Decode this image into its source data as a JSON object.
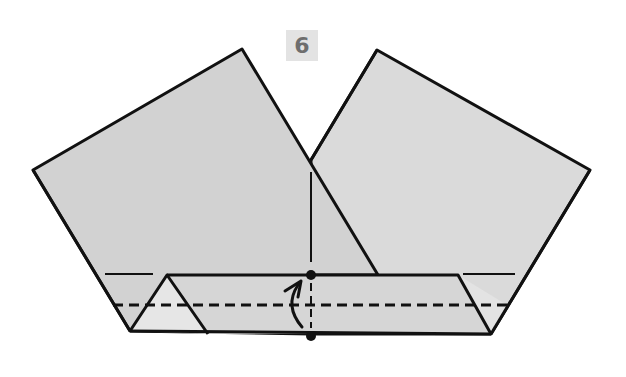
{
  "step": {
    "number": "6",
    "badge_bg": "#e3e3e3",
    "badge_text_color": "#6e6e6e"
  },
  "diagram": {
    "type": "origami-fold-instruction",
    "paper_fill": "#d4d4d4",
    "paper_fill_light": "#dcdcdc",
    "flap_fill": "#e4e4e4",
    "line_color": "#111111",
    "elements": [
      {
        "name": "left-square-panel",
        "description": "rotated square, left"
      },
      {
        "name": "right-square-panel",
        "description": "rotated square, right"
      },
      {
        "name": "folded-bottom-strip",
        "description": "horizontal band folded along bottom"
      },
      {
        "name": "valley-fold-line",
        "style": "dashed",
        "orientation": "horizontal"
      },
      {
        "name": "center-reference-line",
        "style": "dash-dot",
        "orientation": "vertical"
      },
      {
        "name": "fold-up-arrow",
        "direction": "up"
      },
      {
        "name": "reference-point-top"
      },
      {
        "name": "reference-point-bottom"
      }
    ]
  }
}
